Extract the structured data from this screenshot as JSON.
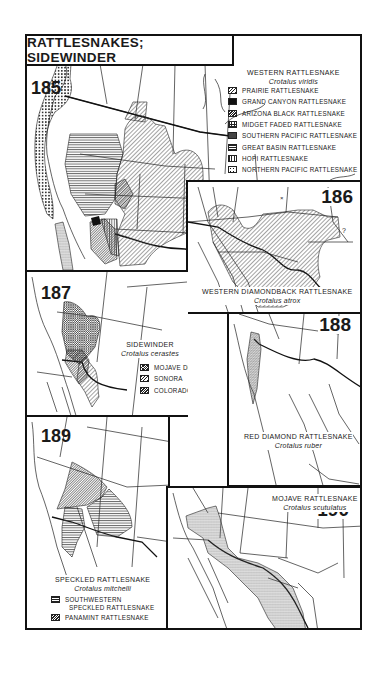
{
  "page": {
    "title": "RATTLESNAKES; SIDEWINDER"
  },
  "maps": [
    {
      "number": "185",
      "species": "WESTERN RATTLESNAKE",
      "scientific": "Crotalus viridis",
      "legend": [
        {
          "label": "PRAIRIE RATTLESNAKE",
          "pattern": "diagonal-hatch"
        },
        {
          "label": "GRAND CANYON RATTLESNAKE",
          "pattern": "solid-black"
        },
        {
          "label": "ARIZONA BLACK RATTLESNAKE",
          "pattern": "dense-hatch"
        },
        {
          "label": "MIDGET FADED RATTLESNAKE",
          "pattern": "grid"
        },
        {
          "label": "SOUTHERN PACIFIC RATTLESNAKE",
          "pattern": "stipple"
        },
        {
          "label": "GREAT BASIN RATTLESNAKE",
          "pattern": "horizontal-lines"
        },
        {
          "label": "HOPI RATTLESNAKE",
          "pattern": "vertical-lines"
        },
        {
          "label": "NORTHERN PACIFIC RATTLESNAKE",
          "pattern": "dots"
        }
      ]
    },
    {
      "number": "186",
      "species": "WESTERN DIAMONDBACK RATTLESNAKE",
      "scientific": "Crotalus atrox",
      "annotation": "?"
    },
    {
      "number": "187",
      "species": "SIDEWINDER",
      "scientific": "Crotalus cerastes",
      "legend": [
        {
          "label": "MOJAVE DESERT",
          "pattern": "cross-hatch"
        },
        {
          "label": "SONORA",
          "pattern": "diagonal-hatch"
        },
        {
          "label": "COLORADO DESERT",
          "pattern": "dense-hatch"
        }
      ]
    },
    {
      "number": "188",
      "species": "RED DIAMOND RATTLESNAKE",
      "scientific": "Crotalus ruber"
    },
    {
      "number": "189",
      "species": "SPECKLED RATTLESNAKE",
      "scientific": "Crotalus mitchelli",
      "legend": [
        {
          "label": "SOUTHWESTERN SPECKLED RATTLESNAKE",
          "line1": "SOUTHWESTERN",
          "line2": "SPECKLED RATTLESNAKE",
          "pattern": "horizontal-lines"
        },
        {
          "label": "PANAMINT RATTLESNAKE",
          "pattern": "dense-hatch"
        }
      ]
    },
    {
      "number": "190",
      "species": "MOJAVE RATTLESNAKE",
      "scientific": "Crotalus scutulatus"
    }
  ]
}
